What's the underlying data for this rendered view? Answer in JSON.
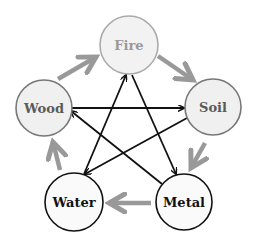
{
  "diagram": {
    "nodes": [
      {
        "id": "fire",
        "label": "Fire",
        "cx": 129,
        "cy": 45,
        "r": 29,
        "fill": "#f2f2f2",
        "stroke": "#aaaaaa",
        "text_color": "#9a9a9a"
      },
      {
        "id": "soil",
        "label": "Soil",
        "cx": 213,
        "cy": 107,
        "r": 28,
        "fill": "#f0f0f0",
        "stroke": "#777777",
        "text_color": "#5a5a5a"
      },
      {
        "id": "metal",
        "label": "Metal",
        "cx": 184,
        "cy": 202,
        "r": 28,
        "fill": "#fafafa",
        "stroke": "#111111",
        "text_color": "#111111"
      },
      {
        "id": "water",
        "label": "Water",
        "cx": 74,
        "cy": 202,
        "r": 29,
        "fill": "#fafafa",
        "stroke": "#111111",
        "text_color": "#111111"
      },
      {
        "id": "wood",
        "label": "Wood",
        "cx": 44,
        "cy": 108,
        "r": 28,
        "fill": "#f0f0f0",
        "stroke": "#777777",
        "text_color": "#5a5a5a"
      }
    ],
    "generating_cycle": {
      "color": "#999999",
      "edges": [
        {
          "from": "Wood",
          "to": "Fire",
          "x1": 58,
          "y1": 79,
          "x2": 96,
          "y2": 57
        },
        {
          "from": "Fire",
          "to": "Soil",
          "x1": 158,
          "y1": 56,
          "x2": 193,
          "y2": 80
        },
        {
          "from": "Soil",
          "to": "Metal",
          "x1": 205,
          "y1": 143,
          "x2": 191,
          "y2": 168
        },
        {
          "from": "Metal",
          "to": "Water",
          "x1": 151,
          "y1": 203,
          "x2": 109,
          "y2": 203
        },
        {
          "from": "Water",
          "to": "Wood",
          "x1": 60,
          "y1": 170,
          "x2": 53,
          "y2": 142
        }
      ]
    },
    "overcoming_cycle": {
      "color": "#111111",
      "edges": [
        {
          "from": "Wood",
          "to": "Soil",
          "x1": 72,
          "y1": 108,
          "x2": 184,
          "y2": 108
        },
        {
          "from": "Soil",
          "to": "Water",
          "x1": 187,
          "y1": 118,
          "x2": 85,
          "y2": 174
        },
        {
          "from": "Water",
          "to": "Fire",
          "x1": 84,
          "y1": 174,
          "x2": 126,
          "y2": 75
        },
        {
          "from": "Fire",
          "to": "Metal",
          "x1": 132,
          "y1": 75,
          "x2": 176,
          "y2": 174
        },
        {
          "from": "Metal",
          "to": "Wood",
          "x1": 162,
          "y1": 184,
          "x2": 71,
          "y2": 111
        }
      ]
    }
  }
}
